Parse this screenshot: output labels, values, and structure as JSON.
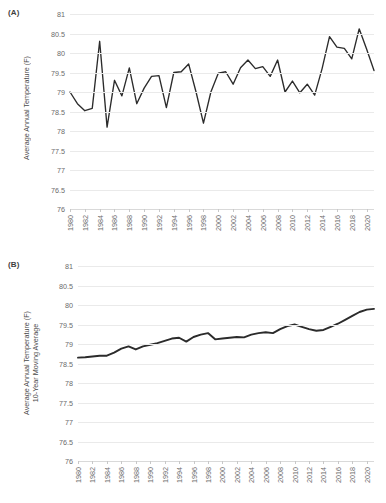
{
  "figure": {
    "background": "#ffffff",
    "line_color": "#2b2b2b",
    "grid_color": "#eaeaea",
    "tick_label_color": "#6b6b6b"
  },
  "panels": [
    {
      "label": "(A)",
      "ylabel": "Average Annual Temperature (F)",
      "ylabel_line2": "",
      "ymin": 76,
      "ymax": 81,
      "ystep": 0.5,
      "yticks": [
        "76",
        "76.5",
        "77",
        "77.5",
        "78",
        "78.5",
        "79",
        "79.5",
        "80",
        "80.5",
        "81"
      ],
      "xticks": [
        "1980",
        "1982",
        "1984",
        "1986",
        "1988",
        "1990",
        "1992",
        "1994",
        "1996",
        "1998",
        "2000",
        "2002",
        "2004",
        "2006",
        "2008",
        "2010",
        "2012",
        "2014",
        "2016",
        "2018",
        "2020"
      ]
    },
    {
      "label": "(B)",
      "ylabel": "Average Annual Temperature (F)",
      "ylabel_line2": "10-Year Moving Average",
      "ymin": 76,
      "ymax": 81,
      "ystep": 0.5,
      "yticks": [
        "76",
        "76.5",
        "77",
        "77.5",
        "78",
        "78.5",
        "79",
        "79.5",
        "80",
        "80.5",
        "81"
      ],
      "xticks": [
        "1980",
        "1982",
        "1984",
        "1986",
        "1988",
        "1990",
        "1992",
        "1994",
        "1996",
        "1998",
        "2000",
        "2002",
        "2004",
        "2006",
        "2008",
        "2010",
        "2012",
        "2014",
        "2016",
        "2018",
        "2020"
      ]
    }
  ],
  "chart_data": [
    {
      "type": "line",
      "title": "(A)",
      "xlabel": "",
      "ylabel": "Average Annual Temperature (F)",
      "ylim": [
        76,
        81
      ],
      "xlim": [
        1980,
        2021
      ],
      "grid": true,
      "legend": "none",
      "x": [
        1980,
        1981,
        1982,
        1983,
        1984,
        1985,
        1986,
        1987,
        1988,
        1989,
        1990,
        1991,
        1992,
        1993,
        1994,
        1995,
        1996,
        1997,
        1998,
        1999,
        2000,
        2001,
        2002,
        2003,
        2004,
        2005,
        2006,
        2007,
        2008,
        2009,
        2010,
        2011,
        2012,
        2013,
        2014,
        2015,
        2016,
        2017,
        2018,
        2019,
        2020,
        2021
      ],
      "values": [
        79.0,
        78.7,
        78.52,
        78.58,
        80.3,
        78.1,
        79.3,
        78.9,
        79.62,
        78.7,
        79.1,
        79.4,
        79.42,
        78.6,
        79.5,
        79.52,
        79.72,
        79.0,
        78.2,
        79.0,
        79.48,
        79.52,
        79.2,
        79.62,
        79.82,
        79.6,
        79.65,
        79.4,
        79.82,
        79.0,
        79.28,
        78.98,
        79.2,
        78.92,
        79.6,
        80.42,
        80.15,
        80.12,
        79.85,
        80.62,
        80.1,
        79.55
      ]
    },
    {
      "type": "line",
      "title": "(B)",
      "xlabel": "",
      "ylabel": "Average Annual Temperature (F) 10-Year Moving Average",
      "ylim": [
        76,
        81
      ],
      "xlim": [
        1980,
        2021
      ],
      "grid": true,
      "legend": "none",
      "x": [
        1980,
        1981,
        1982,
        1983,
        1984,
        1985,
        1986,
        1987,
        1988,
        1989,
        1990,
        1991,
        1992,
        1993,
        1994,
        1995,
        1996,
        1997,
        1998,
        1999,
        2000,
        2001,
        2002,
        2003,
        2004,
        2005,
        2006,
        2007,
        2008,
        2009,
        2010,
        2011,
        2012,
        2013,
        2014,
        2015,
        2016,
        2017,
        2018,
        2019,
        2020,
        2021
      ],
      "values": [
        78.65,
        78.66,
        78.68,
        78.7,
        78.7,
        78.78,
        78.88,
        78.94,
        78.86,
        78.94,
        78.98,
        79.02,
        79.08,
        79.14,
        79.16,
        79.06,
        79.18,
        79.24,
        79.28,
        79.12,
        79.14,
        79.16,
        79.18,
        79.17,
        79.24,
        79.28,
        79.3,
        79.28,
        79.38,
        79.46,
        79.5,
        79.44,
        79.38,
        79.34,
        79.36,
        79.44,
        79.52,
        79.62,
        79.72,
        79.82,
        79.88,
        79.9
      ]
    }
  ]
}
